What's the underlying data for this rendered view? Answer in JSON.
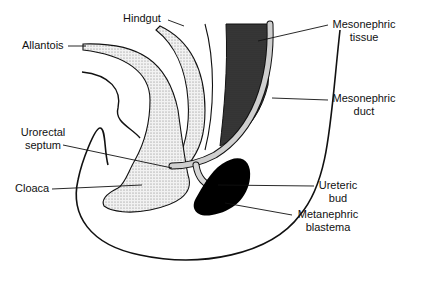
{
  "diagram": {
    "labels": {
      "hindgut": "Hindgut",
      "allantois": "Allantois",
      "mesonephric_tissue_1": "Mesonephric",
      "mesonephric_tissue_2": "tissue",
      "mesonephric_duct_1": "Mesonephric",
      "mesonephric_duct_2": "duct",
      "urorectal_septum_1": "Urorectal",
      "urorectal_septum_2": "septum",
      "cloaca": "Cloaca",
      "ureteric_bud_1": "Ureteric",
      "ureteric_bud_2": "bud",
      "metanephric_blastema_1": "Metanephric",
      "metanephric_blastema_2": "blastema"
    },
    "colors": {
      "line": "#111111",
      "stipple": "#d9d9d9",
      "dark_tissue": "#3a3a3a",
      "blastema": "#000000"
    }
  }
}
